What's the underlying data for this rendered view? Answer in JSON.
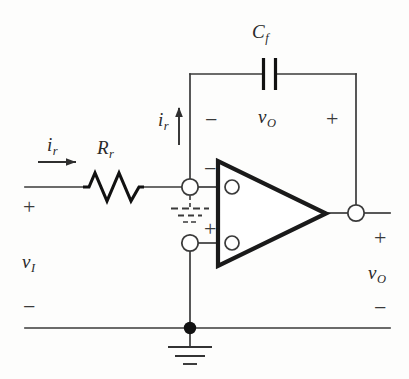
{
  "figure": {
    "type": "circuit-schematic",
    "background_color": "#fdfdfc",
    "ink_color": "#2a2a2a",
    "opamp_outline_color": "#1a1a1a"
  },
  "components": {
    "resistor": {
      "symbol_type": "zigzag",
      "label_var": "R",
      "label_sub": "r"
    },
    "capacitor": {
      "symbol_type": "parallel-plates",
      "label_var": "C",
      "label_sub": "f"
    },
    "opamp": {
      "symbol_type": "triangle",
      "inverting_label": "−",
      "noninverting_label": "+"
    },
    "ground": {
      "symbol_type": "earth-ground-bars"
    },
    "virtual_ground": {
      "symbol_type": "dashed-ground-bars"
    }
  },
  "labels": {
    "input_current_var": "i",
    "input_current_sub": "r",
    "feedback_current_var": "i",
    "feedback_current_sub": "r",
    "resistor_var": "R",
    "resistor_sub": "r",
    "capacitor_var": "C",
    "capacitor_sub": "f",
    "input_voltage_var": "v",
    "input_voltage_sub": "I",
    "output_voltage_var": "v",
    "output_voltage_sub": "O",
    "cap_voltage_var": "v",
    "cap_voltage_sub": "O",
    "input_plus": "+",
    "input_minus": "−",
    "output_plus": "+",
    "output_minus": "−",
    "cap_left_minus": "−",
    "cap_right_plus": "+",
    "opamp_inverting": "−",
    "opamp_noninverting": "+"
  },
  "nodes": {
    "inverting_input_node": "open-circle",
    "noninverting_input_node": "open-circle",
    "output_node": "open-circle",
    "ground_junction": "filled-dot"
  }
}
